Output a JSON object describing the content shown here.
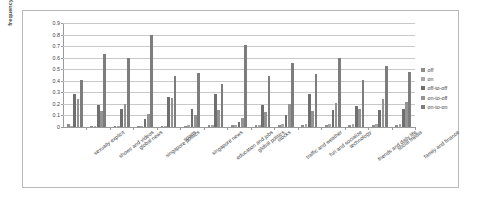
{
  "chart_data": {
    "type": "bar",
    "title": "",
    "xlabel": "",
    "ylabel": "frequency (in %)",
    "ylim": [
      0,
      0.9
    ],
    "ytick_labels": [
      "0",
      "0.1",
      "0.2",
      "0.3",
      "0.4",
      "0.5",
      "0.6",
      "0.7",
      "0.8",
      "0.9"
    ],
    "ytick_values": [
      0,
      0.1,
      0.2,
      0.3,
      0.4,
      0.5,
      0.6,
      0.7,
      0.8,
      0.9
    ],
    "grid": true,
    "legend_position": "right",
    "categories": [
      "sexually explicit",
      "shows and videos",
      "global news",
      "singapore politics",
      "sports",
      "singapore news",
      "education and jobs",
      "global politics",
      "stocks",
      "traffic and weather",
      "fun and socialize",
      "technology",
      "friends and daily life",
      "social media",
      "family and finance"
    ],
    "series": [
      {
        "name": "off",
        "color": "#8d8d8d",
        "values": [
          0.03,
          0.01,
          0.01,
          0.01,
          0.01,
          0.01,
          0.02,
          0.02,
          0.02,
          0.02,
          0.02,
          0.02,
          0.02,
          0.02,
          0.02
        ]
      },
      {
        "name": "on",
        "color": "#a8a8a8",
        "values": [
          0.01,
          0.01,
          0.01,
          0.01,
          0.01,
          0.02,
          0.02,
          0.02,
          0.02,
          0.03,
          0.03,
          0.03,
          0.03,
          0.03,
          0.03
        ]
      },
      {
        "name": "off-to-off",
        "color": "#6f6f6f",
        "values": [
          0.29,
          0.19,
          0.16,
          0.07,
          0.26,
          0.16,
          0.29,
          0.04,
          0.19,
          0.1,
          0.29,
          0.15,
          0.18,
          0.15,
          0.16
        ]
      },
      {
        "name": "on-to-off",
        "color": "#949494",
        "values": [
          0.24,
          0.14,
          0.2,
          0.11,
          0.25,
          0.1,
          0.15,
          0.08,
          0.13,
          0.2,
          0.14,
          0.21,
          0.16,
          0.24,
          0.22
        ]
      },
      {
        "name": "on-to-on",
        "color": "#7d7d7d",
        "values": [
          0.41,
          0.63,
          0.6,
          0.8,
          0.44,
          0.47,
          0.37,
          0.71,
          0.44,
          0.55,
          0.46,
          0.6,
          0.41,
          0.53,
          0.48
        ]
      }
    ]
  },
  "legend": {
    "items": [
      "off",
      "on",
      "off-to-off",
      "on-to-off",
      "on-to-on"
    ]
  }
}
